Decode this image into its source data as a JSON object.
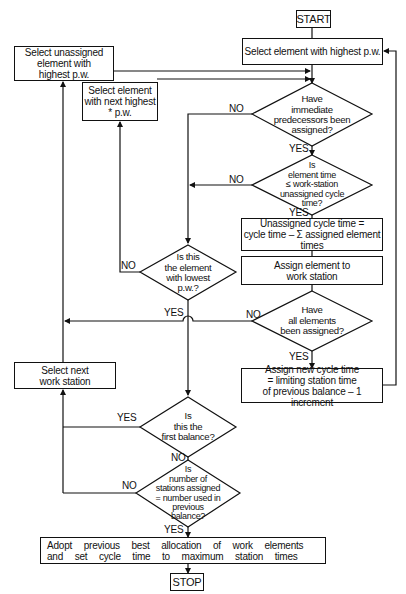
{
  "diagram": {
    "type": "flowchart",
    "nodes": {
      "start": {
        "shape": "terminal",
        "label": "START"
      },
      "select_highest": {
        "shape": "process",
        "label": "Select element with highest p.w."
      },
      "select_unassigned": {
        "shape": "process",
        "label": "Select unassigned\nelement with\nhighest p.w."
      },
      "select_next_highest": {
        "shape": "process",
        "label": "Select element\nwith next highest\n* p.w."
      },
      "predecessors_assigned": {
        "shape": "decision",
        "label": "Have\nimmediate\npredecessors been\nassigned?"
      },
      "element_time_check": {
        "shape": "decision",
        "label": "Is\nelement time\n≤ work-station\nunassigned cycle\ntime?"
      },
      "unassigned_cycle_time": {
        "shape": "process",
        "label": "Unassigned cycle time =\ncycle time – Σ assigned element\ntimes"
      },
      "assign_element": {
        "shape": "process",
        "label": "Assign element to\nwork station"
      },
      "lowest_pw": {
        "shape": "decision",
        "label": "Is this\nthe element\nwith lowest\np.w.?"
      },
      "all_assigned": {
        "shape": "decision",
        "label": "Have\nall elements\nbeen assigned?"
      },
      "select_next_station": {
        "shape": "process",
        "label": "Select next\nwork station"
      },
      "assign_new_cycle": {
        "shape": "process",
        "label": "Assign new cycle time\n= limiting station time\nof previous balance – 1 increment"
      },
      "first_balance": {
        "shape": "decision",
        "label": "Is\nthis the\nfirst balance?"
      },
      "stations_equal": {
        "shape": "decision",
        "label": "Is\nnumber of\nstations assigned\n= number used in\nprevious\nbalance?"
      },
      "adopt_previous": {
        "shape": "process",
        "label": "Adopt previous best allocation of work elements\nand set cycle time to maximum station times"
      },
      "stop": {
        "shape": "terminal",
        "label": "STOP"
      }
    },
    "edge_labels": {
      "yes": "YES",
      "no": "NO"
    },
    "edges": [
      {
        "from": "start",
        "to": "select_highest"
      },
      {
        "from": "select_highest",
        "to": "predecessors_assigned"
      },
      {
        "from": "select_unassigned",
        "to": "predecessors_assigned"
      },
      {
        "from": "select_next_highest",
        "to": "predecessors_assigned"
      },
      {
        "from": "predecessors_assigned",
        "to": "element_time_check",
        "label": "YES"
      },
      {
        "from": "predecessors_assigned",
        "to": "lowest_pw",
        "label": "NO"
      },
      {
        "from": "element_time_check",
        "to": "unassigned_cycle_time",
        "label": "YES"
      },
      {
        "from": "element_time_check",
        "to": "lowest_pw",
        "label": "NO"
      },
      {
        "from": "unassigned_cycle_time",
        "to": "assign_element"
      },
      {
        "from": "assign_element",
        "to": "all_assigned"
      },
      {
        "from": "lowest_pw",
        "to": "select_next_highest",
        "label": "NO"
      },
      {
        "from": "lowest_pw",
        "to": "select_unassigned",
        "label": "YES"
      },
      {
        "from": "all_assigned",
        "to": "select_unassigned",
        "label": "NO"
      },
      {
        "from": "all_assigned",
        "to": "assign_new_cycle",
        "label": "YES"
      },
      {
        "from": "assign_new_cycle",
        "to": "first_balance"
      },
      {
        "from": "assign_new_cycle",
        "to": "select_highest"
      },
      {
        "from": "first_balance",
        "to": "select_next_station",
        "label": "YES"
      },
      {
        "from": "first_balance",
        "to": "stations_equal",
        "label": "NO"
      },
      {
        "from": "stations_equal",
        "to": "select_next_station",
        "label": "NO"
      },
      {
        "from": "stations_equal",
        "to": "adopt_previous",
        "label": "YES"
      },
      {
        "from": "select_next_station",
        "to": "select_unassigned"
      },
      {
        "from": "adopt_previous",
        "to": "stop"
      }
    ]
  }
}
